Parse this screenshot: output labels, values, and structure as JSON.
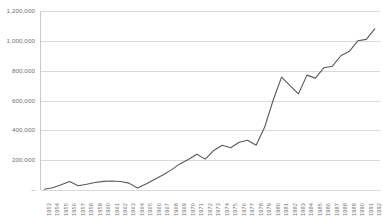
{
  "chart_data": {
    "type": "line",
    "title": "",
    "subtitle": "",
    "xlabel": "",
    "ylabel": "",
    "grid": true,
    "legend": false,
    "legend_position": "none",
    "line_color": "#595959",
    "gridline_color": "#d9d9d9",
    "axis_color": "#c9c9c9",
    "text_color": "#6f6f6f",
    "ylim": [
      0,
      1200000
    ],
    "ytick_values": [
      0,
      200000,
      400000,
      600000,
      800000,
      1000000,
      1200000
    ],
    "ytick_labels": [
      "–",
      "200,000",
      "400,000",
      "600,000",
      "800,000",
      "1,000,000",
      "1,200,000"
    ],
    "xlim": [
      "1953",
      "1992"
    ],
    "categories": [
      "1953",
      "1954",
      "1955",
      "1956",
      "1957",
      "1958",
      "1959",
      "1960",
      "1961",
      "1962",
      "1963",
      "1964",
      "1965",
      "1966",
      "1967",
      "1968",
      "1969",
      "1970",
      "1971",
      "1972",
      "1973",
      "1974",
      "1975",
      "1976",
      "1977",
      "1978",
      "1979",
      "1980",
      "1981",
      "1982",
      "1983",
      "1984",
      "1985",
      "1986",
      "1987",
      "1988",
      "1989",
      "1990",
      "1991",
      "1992"
    ],
    "values": [
      5000,
      15000,
      35000,
      57000,
      28000,
      38000,
      50000,
      58000,
      60000,
      57000,
      46000,
      14000,
      40000,
      70000,
      100000,
      135000,
      175000,
      205000,
      240000,
      207000,
      265000,
      300000,
      283000,
      320000,
      333000,
      300000,
      420000,
      600000,
      757000,
      700000,
      645000,
      770000,
      750000,
      820000,
      830000,
      900000,
      930000,
      1000000,
      1010000,
      1080000
    ],
    "series": [
      {
        "name": "Series 1",
        "values": [
          5000,
          15000,
          35000,
          57000,
          28000,
          38000,
          50000,
          58000,
          60000,
          57000,
          46000,
          14000,
          40000,
          70000,
          100000,
          135000,
          175000,
          205000,
          240000,
          207000,
          265000,
          300000,
          283000,
          320000,
          333000,
          300000,
          420000,
          600000,
          757000,
          700000,
          645000,
          770000,
          750000,
          820000,
          830000,
          900000,
          930000,
          1000000,
          1010000,
          1080000
        ]
      }
    ]
  }
}
